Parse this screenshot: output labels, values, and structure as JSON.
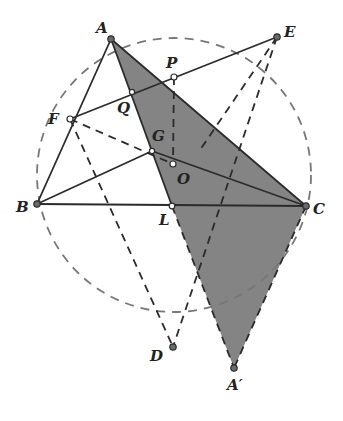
{
  "figure": {
    "type": "geometry-diagram",
    "colors": {
      "background": "#ffffff",
      "line": "#2b2b2b",
      "shade": "#6e6e6e",
      "circle": "#777777"
    },
    "circle": {
      "label": "circumcircle",
      "cx": 174,
      "cy": 175,
      "r": 137,
      "style": "dashed"
    },
    "points": {
      "A": {
        "label": "A",
        "x": 111,
        "y": 39
      },
      "B": {
        "label": "B",
        "x": 37,
        "y": 204
      },
      "C": {
        "label": "C",
        "x": 306,
        "y": 206
      },
      "E": {
        "label": "E",
        "x": 277,
        "y": 37
      },
      "P": {
        "label": "P",
        "x": 174,
        "y": 77
      },
      "Q": {
        "label": "Q",
        "x": 132,
        "y": 92
      },
      "F": {
        "label": "F",
        "x": 70,
        "y": 119
      },
      "G": {
        "label": "G",
        "x": 152,
        "y": 151
      },
      "O": {
        "label": "O",
        "x": 173,
        "y": 164
      },
      "L": {
        "label": "L",
        "x": 172,
        "y": 206
      },
      "D": {
        "label": "D",
        "x": 173,
        "y": 347
      },
      "A_prime": {
        "label": "A′",
        "x": 234,
        "y": 368
      }
    },
    "shaded_regions": [
      "triangle A C A′ (split at L)"
    ],
    "solid_segments": [
      "AB",
      "BC",
      "AC",
      "FE",
      "BG",
      "GC"
    ],
    "dashed_segments": [
      "FO",
      "PO",
      "FD",
      "ED",
      "EL",
      "LA′",
      "CA′"
    ]
  }
}
